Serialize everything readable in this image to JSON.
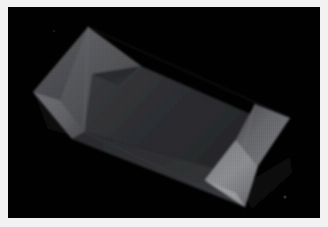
{
  "image": {
    "kind": "photograph",
    "title": "Folded sheet on black background",
    "subject": "crumpled folded fabric sheet",
    "background_color": "#010101",
    "frame_color": "#f2f2f2",
    "frame_inner_border_color": "#d6d6d6",
    "width_px": 328,
    "height_px": 227,
    "lighting": "low-key, single soft light from lower right",
    "orientation": "landscape"
  },
  "palette": {
    "background": "#010101",
    "shadow_deep": "#0a0a0a",
    "sheet_dark": "#2f3033",
    "sheet_dark_2": "#26272a",
    "sheet_mid": "#4a4b4e",
    "sheet_mid_2": "#5c5d60",
    "sheet_light": "#74757a",
    "sheet_bright": "#8d8e92",
    "sheet_highlight": "#a0a1a5",
    "crease_line": "#6f7074",
    "speck": "#4a4a4a"
  },
  "geometry": {
    "note": "Polygon vertices in 328x227 screenshot pixel space; the sheet is a long quadrilateral running from upper-left to lower-right with folded-back triangular corner flaps on the left and right.",
    "sheet_outline": "88,27 290,118 245,207 33,92",
    "facets": [
      {
        "name": "upper-left-flap",
        "points": "88,27 141,66 92,74 60,100 33,92",
        "tone": "sheet_mid"
      },
      {
        "name": "left-fold-triangle-upper",
        "points": "88,27 141,66 84,132 60,100",
        "tone": "sheet_mid_2"
      },
      {
        "name": "left-fold-triangle-lower",
        "points": "33,92 60,100 84,132 72,139",
        "tone": "sheet_light"
      },
      {
        "name": "left-tuck-wedge",
        "points": "92,74 141,66 120,86",
        "tone": "sheet_dark_2"
      },
      {
        "name": "main-face",
        "points": "141,66 255,116 236,174 84,132 92,74 141,66",
        "tone": "sheet_dark"
      },
      {
        "name": "main-face-lower",
        "points": "84,132 236,174 245,207 72,139",
        "tone": "sheet_dark_2"
      },
      {
        "name": "right-flap-upper",
        "points": "255,104 290,118 258,166 236,140",
        "tone": "sheet_light"
      },
      {
        "name": "right-flap-lower",
        "points": "236,140 258,166 245,207 205,180",
        "tone": "sheet_bright"
      },
      {
        "name": "right-highlight-edge",
        "points": "205,180 245,207 236,193",
        "tone": "sheet_highlight"
      }
    ],
    "creases": [
      {
        "name": "left-diagonal-crease",
        "from": "88,27",
        "to": "84,132"
      },
      {
        "name": "left-lower-crease",
        "from": "60,100",
        "to": "84,132"
      },
      {
        "name": "spine-crease",
        "from": "141,66",
        "to": "120,86"
      },
      {
        "name": "right-fold-crease",
        "from": "255,104",
        "to": "236,174"
      },
      {
        "name": "bottom-fold-crease",
        "from": "84,132",
        "to": "245,207"
      }
    ],
    "specks": [
      {
        "name": "dust-speck",
        "cx": 288,
        "cy": 199,
        "r": 1.6
      },
      {
        "name": "dust-speck",
        "cx": 53,
        "cy": 30,
        "r": 0.9
      }
    ]
  },
  "labels": {
    "frame": "photo-frame",
    "canvas": "photo-canvas",
    "subject_alt": "Dark folded sheet photographed against a black backdrop"
  }
}
